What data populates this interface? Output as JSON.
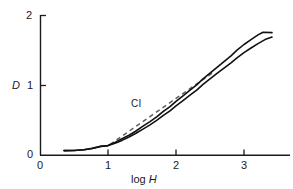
{
  "chart_data": {
    "type": "line",
    "title": "",
    "subtitle": "",
    "xlabel": "log H",
    "ylabel": "D",
    "xlim": [
      0,
      3.3
    ],
    "ylim": [
      0,
      2
    ],
    "xticks": [
      0,
      1,
      2,
      3
    ],
    "yticks": [
      0,
      1,
      2
    ],
    "xtick_labels": [
      "0",
      "1",
      "2",
      "3"
    ],
    "ytick_labels": [
      "0",
      "1",
      "2"
    ],
    "grid": false,
    "legend_position": "none",
    "annotations": [
      {
        "text": "CI",
        "x": 1.38,
        "y": 0.78,
        "describes": "contrast-index-tangent-line"
      }
    ],
    "series": [
      {
        "name": "characteristic-curve-upper",
        "style": "solid",
        "color": "#111111",
        "x": [
          0.35,
          0.5,
          0.65,
          0.8,
          0.9,
          1.0,
          1.1,
          1.2,
          1.3,
          1.4,
          1.5,
          1.6,
          1.7,
          1.8,
          1.9,
          2.0,
          2.1,
          2.2,
          2.3,
          2.4,
          2.5,
          2.6,
          2.7,
          2.8,
          2.9,
          3.0,
          3.1,
          3.2,
          3.27
        ],
        "y": [
          0.07,
          0.07,
          0.08,
          0.09,
          0.11,
          0.14,
          0.18,
          0.23,
          0.28,
          0.34,
          0.41,
          0.47,
          0.54,
          0.61,
          0.68,
          0.76,
          0.84,
          0.92,
          1.0,
          1.08,
          1.16,
          1.24,
          1.32,
          1.4,
          1.48,
          1.56,
          1.63,
          1.7,
          1.74
        ]
      },
      {
        "name": "characteristic-curve-lower",
        "style": "solid",
        "color": "#111111",
        "x": [
          0.35,
          0.5,
          0.65,
          0.8,
          0.9,
          1.0,
          1.1,
          1.2,
          1.3,
          1.4,
          1.5,
          1.6,
          1.7,
          1.8,
          1.9,
          2.0,
          2.1,
          2.2,
          2.3,
          2.4,
          2.5,
          2.6,
          2.7,
          2.8,
          2.9,
          3.0,
          3.1,
          3.2,
          3.27
        ],
        "y": [
          0.07,
          0.07,
          0.08,
          0.09,
          0.11,
          0.14,
          0.17,
          0.21,
          0.26,
          0.31,
          0.37,
          0.43,
          0.5,
          0.57,
          0.64,
          0.72,
          0.8,
          0.88,
          0.96,
          1.04,
          1.12,
          1.2,
          1.27,
          1.34,
          1.41,
          1.48,
          1.54,
          1.6,
          1.63
        ]
      },
      {
        "name": "contrast-index-line",
        "style": "dashed",
        "color": "#555555",
        "x": [
          1.03,
          2.55
        ],
        "y": [
          0.15,
          1.18
        ]
      }
    ]
  },
  "axes": {
    "y_axis_name": "density-axis",
    "x_axis_name": "log-exposure-axis"
  }
}
